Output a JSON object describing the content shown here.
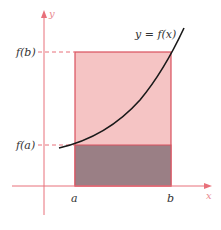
{
  "figure": {
    "curve_label": "y = f(x)",
    "y_axis_label": "y",
    "x_axis_label": "x",
    "tick_labels": {
      "a": "a",
      "b": "b",
      "fa": "f(a)",
      "fb": "f(b)"
    },
    "colors": {
      "axis": "#e8707a",
      "upper_rect": "#f5c4c4",
      "lower_rect": "#9a7f85",
      "rect_border": "#d9505e",
      "dashed": "#e8707a",
      "curve": "#1a1a1a"
    }
  }
}
